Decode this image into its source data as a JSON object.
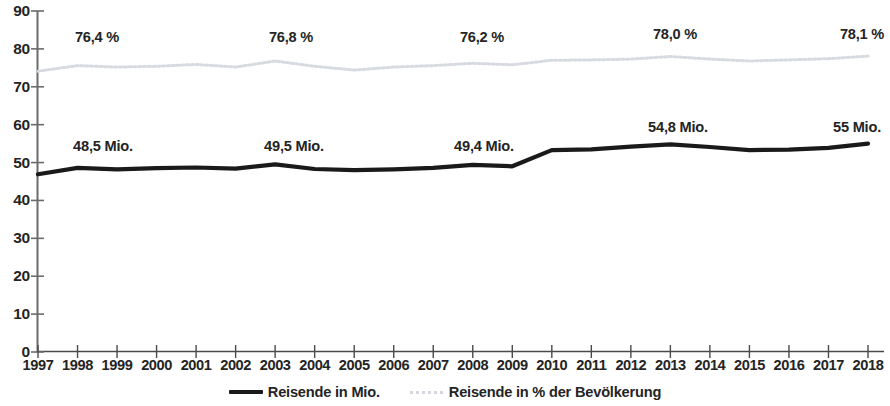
{
  "chart_data": {
    "type": "line",
    "title": "",
    "subtitle": "",
    "xlabel": "",
    "ylabel": "",
    "ylim": [
      0,
      90
    ],
    "ytick_step": 10,
    "yticks": [
      "90",
      "80",
      "70",
      "60",
      "50",
      "40",
      "30",
      "20",
      "10",
      "0"
    ],
    "grid": false,
    "legend_position": "bottom-center",
    "categories": [
      "1997",
      "1998",
      "1999",
      "2000",
      "2001",
      "2002",
      "2003",
      "2004",
      "2005",
      "2006",
      "2007",
      "2008",
      "2009",
      "2010",
      "2011",
      "2012",
      "2013",
      "2014",
      "2015",
      "2016",
      "2017",
      "2018"
    ],
    "series": [
      {
        "name": "Reisende in Mio.",
        "style": "solid-thick",
        "color": "#1a1a1a",
        "values": [
          46.9,
          48.6,
          48.2,
          48.5,
          48.7,
          48.4,
          49.5,
          48.3,
          48.0,
          48.2,
          48.6,
          49.4,
          49.0,
          53.3,
          53.5,
          54.2,
          54.8,
          54.1,
          53.3,
          53.4,
          53.9,
          55.0
        ]
      },
      {
        "name": "Reisende in % der Bevölkerung",
        "style": "dotted",
        "color": "#d4d7dd",
        "values": [
          74.1,
          75.6,
          75.2,
          75.4,
          75.9,
          75.2,
          76.8,
          75.4,
          74.4,
          75.2,
          75.6,
          76.2,
          75.8,
          77.0,
          77.1,
          77.3,
          78.0,
          77.3,
          76.8,
          77.1,
          77.4,
          78.1
        ]
      }
    ],
    "annotations": [
      {
        "text": "76,4 %",
        "series": "Reisende in % der Bevölkerung",
        "category": "1998",
        "kind": "percent"
      },
      {
        "text": "76,8 %",
        "series": "Reisende in % der Bevölkerung",
        "category": "2003",
        "kind": "percent"
      },
      {
        "text": "76,2 %",
        "series": "Reisende in % der Bevölkerung",
        "category": "2008",
        "kind": "percent"
      },
      {
        "text": "78,0 %",
        "series": "Reisende in % der Bevölkerung",
        "category": "2013",
        "kind": "percent"
      },
      {
        "text": "78,1 %",
        "series": "Reisende in % der Bevölkerung",
        "category": "2018",
        "kind": "percent"
      },
      {
        "text": "48,5 Mio.",
        "series": "Reisende in Mio.",
        "category": "1998",
        "kind": "millions"
      },
      {
        "text": "49,5 Mio.",
        "series": "Reisende in Mio.",
        "category": "2003",
        "kind": "millions"
      },
      {
        "text": "49,4 Mio.",
        "series": "Reisende in Mio.",
        "category": "2008",
        "kind": "millions"
      },
      {
        "text": "54,8 Mio.",
        "series": "Reisende in Mio.",
        "category": "2013",
        "kind": "millions"
      },
      {
        "text": "55 Mio.",
        "series": "Reisende in Mio.",
        "category": "2018",
        "kind": "millions"
      }
    ],
    "annotation_positions": [
      {
        "text": "76,4 %",
        "x": 97,
        "y": 30
      },
      {
        "text": "76,8 %",
        "x": 291,
        "y": 30
      },
      {
        "text": "76,2 %",
        "x": 482,
        "y": 30
      },
      {
        "text": "78,0 %",
        "x": 675,
        "y": 27
      },
      {
        "text": "78,1 %",
        "x": 862,
        "y": 27
      },
      {
        "text": "48,5 Mio.",
        "x": 103,
        "y": 139
      },
      {
        "text": "49,5 Mio.",
        "x": 294,
        "y": 139
      },
      {
        "text": "49,4 Mio.",
        "x": 484,
        "y": 139
      },
      {
        "text": "54,8 Mio.",
        "x": 678,
        "y": 120
      },
      {
        "text": "55 Mio.",
        "x": 857,
        "y": 120
      }
    ]
  },
  "legend": {
    "items": [
      {
        "label": "Reisende in Mio.",
        "marker": "solid-line-marker"
      },
      {
        "label": "Reisende in % der Bevölkerung",
        "marker": "dotted-line-marker"
      }
    ]
  },
  "axes": {
    "y_axis_name": "y-axis",
    "x_axis_name": "x-axis"
  },
  "colors": {
    "series_millions": "#1a1a1a",
    "series_percent": "#d4d7dd",
    "axis": "#6b6b6b",
    "text": "#242424"
  }
}
